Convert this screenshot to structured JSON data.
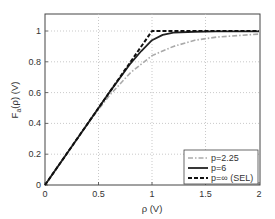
{
  "chart_data": {
    "type": "line",
    "title": "",
    "xlabel": "ρ (V)",
    "ylabel": "F_a(ρ) (V)",
    "xlim": [
      0,
      2
    ],
    "ylim": [
      0,
      1.1
    ],
    "grid": true,
    "legend_position": "lower right",
    "x_ticks": [
      "0",
      "0.5",
      "1",
      "1.5",
      "2"
    ],
    "y_ticks": [
      "0",
      "0.2",
      "0.4",
      "0.6",
      "0.8",
      "1"
    ],
    "series": [
      {
        "name": "p=2.25",
        "style": "dash-dot",
        "color": "#aaaaaa",
        "x": [
          0,
          0.2,
          0.4,
          0.6,
          0.8,
          1.0,
          1.2,
          1.4,
          1.6,
          1.8,
          2.0
        ],
        "y": [
          0,
          0.2,
          0.4,
          0.58,
          0.73,
          0.84,
          0.9,
          0.94,
          0.96,
          0.97,
          0.98
        ]
      },
      {
        "name": "p=6",
        "style": "solid",
        "color": "#222222",
        "x": [
          0,
          0.2,
          0.4,
          0.6,
          0.8,
          0.9,
          1.0,
          1.1,
          1.2,
          1.4,
          1.6,
          2.0
        ],
        "y": [
          0,
          0.2,
          0.4,
          0.6,
          0.79,
          0.87,
          0.94,
          0.975,
          0.99,
          0.995,
          0.997,
          0.998
        ]
      },
      {
        "name": "p=∞ (SEL)",
        "style": "dashed",
        "color": "#111111",
        "x": [
          0,
          1.0,
          2.0
        ],
        "y": [
          0,
          1.0,
          1.0
        ]
      }
    ]
  },
  "legend": {
    "items": [
      {
        "label": "p=2.25"
      },
      {
        "label": "p=6"
      },
      {
        "label": "p=∞ (SEL)"
      }
    ]
  },
  "axes": {
    "xlabel": "ρ (V)",
    "ylabel_main": "F",
    "ylabel_sub": "a",
    "ylabel_rest": "(ρ) (V)",
    "x_ticks": [
      "0",
      "0.5",
      "1",
      "1.5",
      "2"
    ],
    "y_ticks": [
      "0",
      "0.2",
      "0.4",
      "0.6",
      "0.8",
      "1"
    ]
  }
}
